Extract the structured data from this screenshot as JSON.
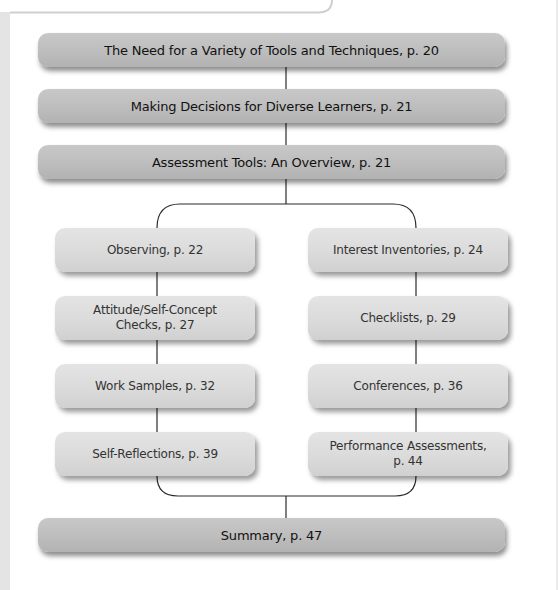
{
  "diagram": {
    "top_banners": [
      {
        "label": "The Need for a Variety of Tools and Techniques, p. 20"
      },
      {
        "label": "Making Decisions for Diverse Learners, p. 21"
      },
      {
        "label": "Assessment Tools: An Overview, p. 21"
      }
    ],
    "left_column": [
      {
        "label": "Observing, p. 22"
      },
      {
        "label": "Attitude/Self-Concept\nChecks, p. 27"
      },
      {
        "label": "Work Samples, p. 32"
      },
      {
        "label": "Self-Reflections, p. 39"
      }
    ],
    "right_column": [
      {
        "label": "Interest Inventories, p. 24"
      },
      {
        "label": "Checklists, p. 29"
      },
      {
        "label": "Conferences, p. 36"
      },
      {
        "label": "Performance Assessments,\np. 44"
      }
    ],
    "bottom_banner": {
      "label": "Summary, p. 47"
    },
    "colors": {
      "banner": "#bdbdbd",
      "box": "#dadada",
      "line": "#333333",
      "text": "#111111"
    }
  }
}
